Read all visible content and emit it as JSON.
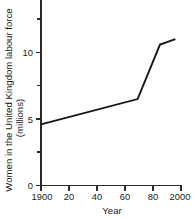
{
  "chart_data": {
    "type": "line",
    "title": "",
    "subtitle": "",
    "xlabel": "Year",
    "ylabel": "Women in the United Kingdom labour force (millions)",
    "ylabel_lines": [
      "Women in the United Kingdom labour force",
      "(millions)"
    ],
    "xlim": [
      1900,
      2000
    ],
    "ylim": [
      0,
      12.9
    ],
    "grid": false,
    "legend": false,
    "legend_position": "none",
    "x_ticks": [
      1900,
      1920,
      1940,
      1960,
      1980,
      2000
    ],
    "x_tick_labels": [
      "1900",
      "20",
      "40",
      "60",
      "80",
      "2000"
    ],
    "y_ticks": [
      0,
      5,
      10
    ],
    "y_tick_labels": [
      "0",
      "5",
      "10"
    ],
    "y_minor_ticks": [
      2.5,
      7.5,
      12.5
    ],
    "series": [
      {
        "name": "Women in the United Kingdom labour force",
        "color": "#161616",
        "x": [
          1900,
          1969,
          1985,
          1996
        ],
        "values": [
          4.6,
          6.5,
          10.6,
          11.0
        ],
        "points": [
          {
            "x": 1900,
            "y": 4.6
          },
          {
            "x": 1969,
            "y": 6.5
          },
          {
            "x": 1985,
            "y": 10.6
          },
          {
            "x": 1996,
            "y": 11.0
          }
        ]
      }
    ],
    "annotations": []
  },
  "figure": {
    "background_color": "#ffffff",
    "axis_color": "#2b2b2b",
    "line_color": "#161616",
    "text_color": "#1a1a1a"
  }
}
